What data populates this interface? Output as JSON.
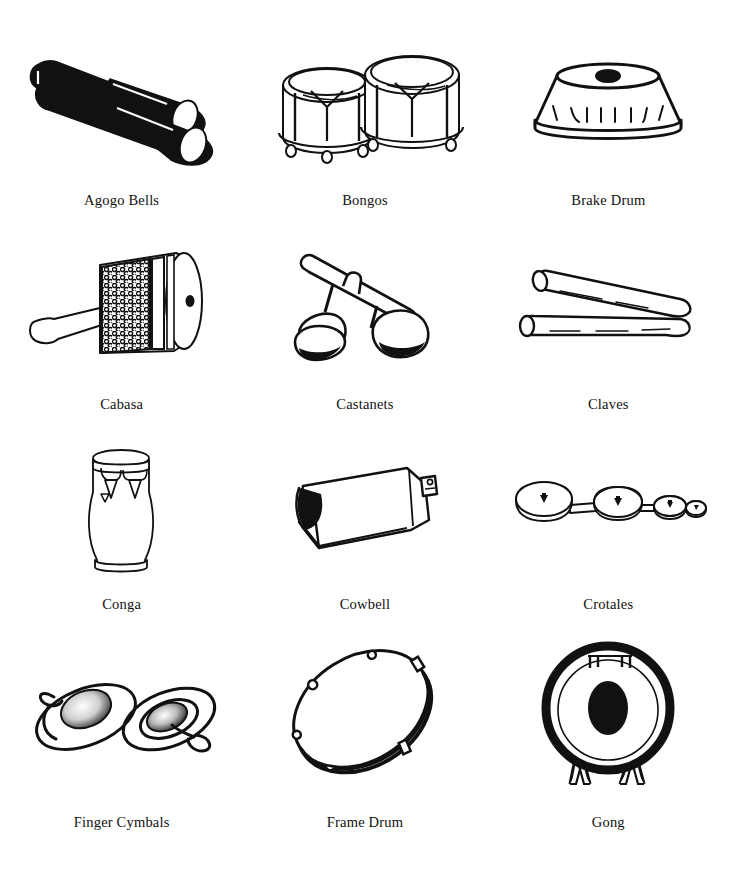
{
  "page": {
    "running_header": "PERCUSSION INSTRUMENTS",
    "background_color": "#ffffff",
    "ink_color": "#111111"
  },
  "grid": {
    "columns": 3,
    "rows": 4,
    "items": [
      {
        "label": "Agogo Bells",
        "icon": "agogo-bells-illustration"
      },
      {
        "label": "Bongos",
        "icon": "bongos-illustration"
      },
      {
        "label": "Brake Drum",
        "icon": "brake-drum-illustration"
      },
      {
        "label": "Cabasa",
        "icon": "cabasa-illustration"
      },
      {
        "label": "Castanets",
        "icon": "castanets-illustration"
      },
      {
        "label": "Claves",
        "icon": "claves-illustration"
      },
      {
        "label": "Conga",
        "icon": "conga-illustration"
      },
      {
        "label": "Cowbell",
        "icon": "cowbell-illustration"
      },
      {
        "label": "Crotales",
        "icon": "crotales-illustration"
      },
      {
        "label": "Finger Cymbals",
        "icon": "finger-cymbals-illustration"
      },
      {
        "label": "Frame Drum",
        "icon": "frame-drum-illustration"
      },
      {
        "label": "Gong",
        "icon": "gong-illustration"
      }
    ]
  }
}
